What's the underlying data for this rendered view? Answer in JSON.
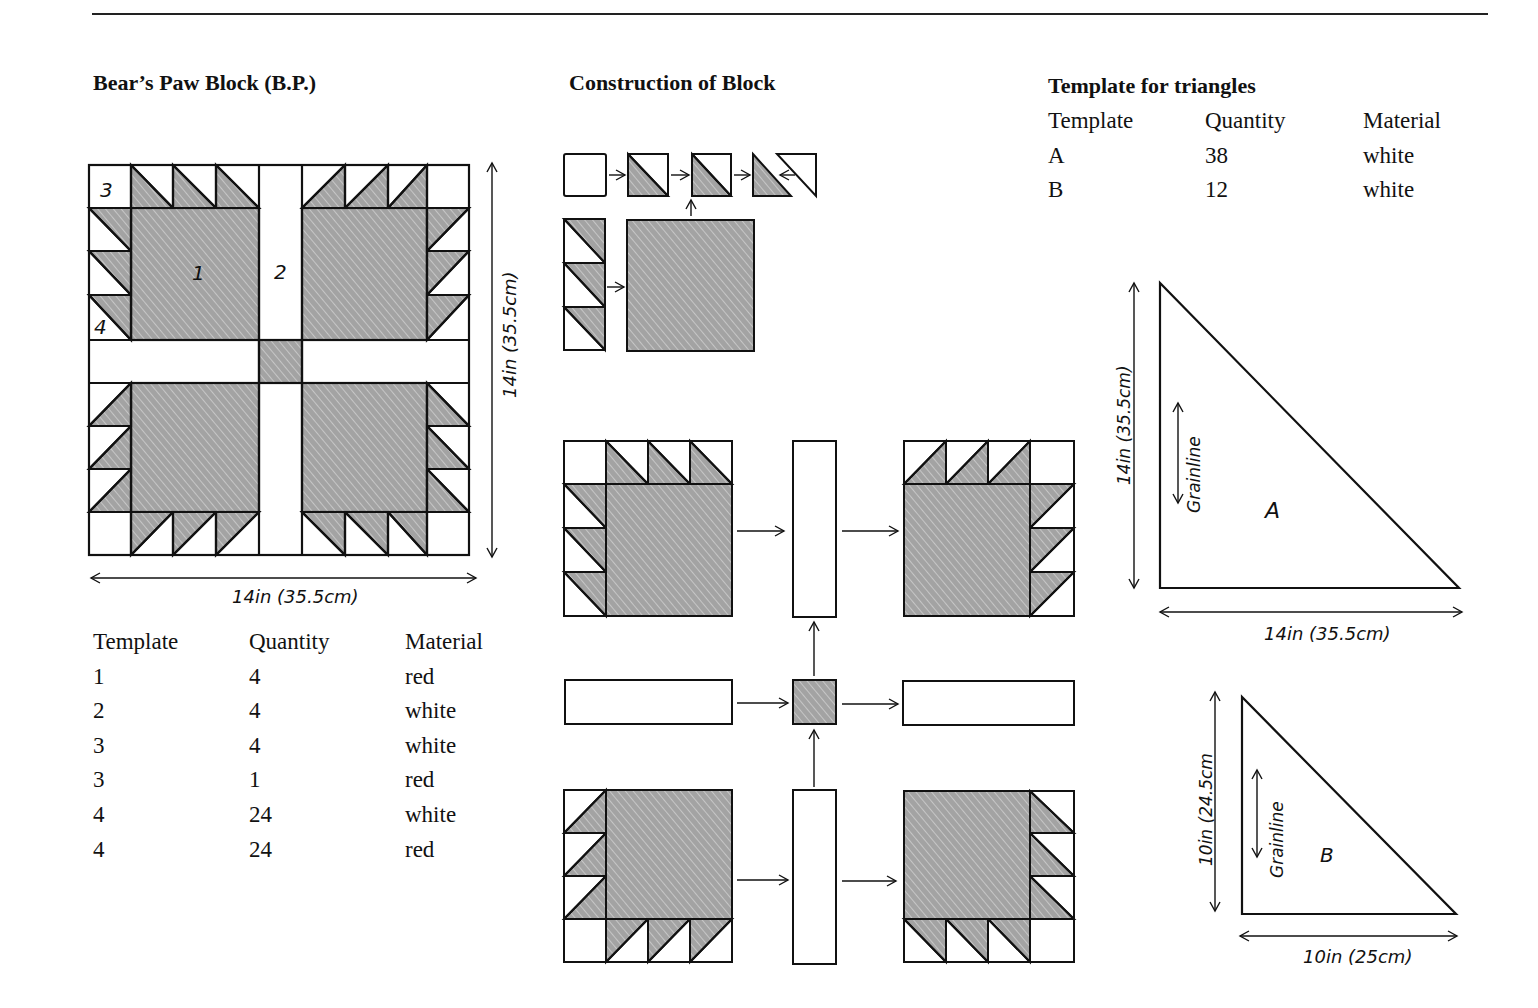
{
  "left": {
    "title": "Bear’s Paw Block (B.P.)",
    "block_labels": {
      "piece1": "1",
      "piece2": "2",
      "piece3": "3",
      "piece4": "4"
    },
    "width_label": "14in (35.5cm)",
    "height_label": "14in (35.5cm)",
    "table": {
      "headers": [
        "Template",
        "Quantity",
        "Material"
      ],
      "rows": [
        [
          "1",
          "4",
          "red"
        ],
        [
          "2",
          "4",
          "white"
        ],
        [
          "3",
          "4",
          "white"
        ],
        [
          "3",
          "1",
          "red"
        ],
        [
          "4",
          "24",
          "white"
        ],
        [
          "4",
          "24",
          "red"
        ]
      ]
    }
  },
  "middle": {
    "title": "Construction of Block"
  },
  "right": {
    "title": "Template for triangles",
    "table": {
      "headers": [
        "Template",
        "Quantity",
        "Material"
      ],
      "rows": [
        [
          "A",
          "38",
          "white"
        ],
        [
          "B",
          "12",
          "white"
        ]
      ]
    },
    "triangle_a": {
      "label": "A",
      "grainline": "Grainline",
      "height_label": "14in (35.5cm)",
      "width_label": "14in (35.5cm)"
    },
    "triangle_b": {
      "label": "B",
      "grainline": "Grainline",
      "height_label": "10in (24.5cm",
      "width_label": "10in (25cm)"
    }
  },
  "colors": {
    "line": "#111111",
    "shade": "#9a9a9a",
    "background": "#ffffff"
  }
}
